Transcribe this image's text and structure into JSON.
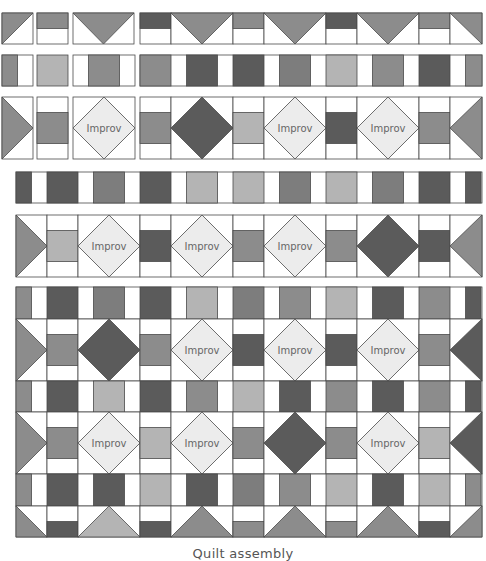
{
  "colors": {
    "dark": "#5b5b5b",
    "medium": "#7d7d7d",
    "mid": "#8c8c8c",
    "light": "#b4b4b4",
    "improv": "#ececec",
    "white": "#ffffff",
    "line": "#4a4a4a"
  },
  "improv_label": "Improv",
  "caption": "Quilt assembly",
  "columns_main": [
    2,
    33,
    72,
    134,
    171,
    233,
    264,
    326,
    357,
    419,
    450,
    482
  ],
  "rows": [
    {
      "id": "row-1-top-border",
      "y": 13,
      "h": 31,
      "pieces": [
        {
          "type": "hst-tl",
          "x": 2,
          "w": 31,
          "color": "mid"
        },
        {
          "type": "rect-top",
          "x": 37,
          "w": 31,
          "color": "mid"
        },
        {
          "type": "goose-down",
          "x": 73,
          "w": 61,
          "color": "mid"
        },
        {
          "type": "rect-top",
          "x": 140,
          "w": 31,
          "color": "dark"
        },
        {
          "type": "goose-down",
          "x": 171,
          "w": 62,
          "color": "mid"
        },
        {
          "type": "rect-top",
          "x": 233,
          "w": 31,
          "color": "mid"
        },
        {
          "type": "goose-down",
          "x": 264,
          "w": 62,
          "color": "mid"
        },
        {
          "type": "rect-top",
          "x": 326,
          "w": 31,
          "color": "dark"
        },
        {
          "type": "goose-down",
          "x": 357,
          "w": 62,
          "color": "mid"
        },
        {
          "type": "rect-top",
          "x": 419,
          "w": 31,
          "color": "mid"
        },
        {
          "type": "hst-tr",
          "x": 450,
          "w": 32,
          "color": "mid"
        }
      ]
    },
    {
      "id": "row-2-sashing",
      "y": 55,
      "h": 31,
      "pieces": [
        {
          "type": "sash-lr",
          "x": 2,
          "w": 31,
          "color": "mid"
        },
        {
          "type": "block",
          "x": 37,
          "w": 31,
          "color": "light"
        },
        {
          "type": "sash-mid",
          "x": 73,
          "w": 62,
          "color": "mid"
        },
        {
          "type": "sash-seq",
          "x": 140,
          "w": 342,
          "seq": [
            "mid",
            "dark",
            "dark",
            "medium",
            "light",
            "mid",
            "dark",
            "mid"
          ]
        }
      ]
    },
    {
      "id": "row-3-blocks",
      "y": 97,
      "h": 62,
      "pieces": [
        {
          "type": "triangle-right",
          "x": 2,
          "w": 31,
          "color": "mid"
        },
        {
          "type": "sq-center",
          "x": 37,
          "w": 31,
          "color": "mid"
        },
        {
          "type": "diamond",
          "x": 73,
          "w": 62,
          "color": "improv",
          "label": true
        },
        {
          "type": "sq-center",
          "x": 140,
          "w": 31,
          "color": "mid"
        },
        {
          "type": "diamond",
          "x": 171,
          "w": 62,
          "color": "dark"
        },
        {
          "type": "sq-center",
          "x": 233,
          "w": 31,
          "color": "light"
        },
        {
          "type": "diamond",
          "x": 264,
          "w": 62,
          "color": "improv",
          "label": true
        },
        {
          "type": "sq-center",
          "x": 326,
          "w": 31,
          "color": "dark"
        },
        {
          "type": "diamond",
          "x": 357,
          "w": 62,
          "color": "improv",
          "label": true
        },
        {
          "type": "sq-center",
          "x": 419,
          "w": 31,
          "color": "mid"
        },
        {
          "type": "triangle-left",
          "x": 450,
          "w": 32,
          "color": "mid"
        }
      ]
    },
    {
      "id": "row-4-sashing",
      "y": 172,
      "h": 31,
      "pieces": [
        {
          "type": "sash-seq-offset",
          "x": 16,
          "w": 466,
          "seq": [
            "dark",
            "dark",
            "medium",
            "dark",
            "light",
            "light",
            "medium",
            "light",
            "medium",
            "dark",
            "dark"
          ]
        }
      ]
    },
    {
      "id": "row-5-blocks",
      "y": 215,
      "h": 62,
      "pieces": [
        {
          "type": "triangle-right",
          "x": 16,
          "w": 31,
          "color": "mid"
        },
        {
          "type": "sq-center",
          "x": 47,
          "w": 31,
          "color": "light"
        },
        {
          "type": "diamond",
          "x": 78,
          "w": 62,
          "color": "improv",
          "label": true
        },
        {
          "type": "sq-center",
          "x": 140,
          "w": 31,
          "color": "dark"
        },
        {
          "type": "diamond",
          "x": 171,
          "w": 62,
          "color": "improv",
          "label": true
        },
        {
          "type": "sq-center",
          "x": 233,
          "w": 31,
          "color": "mid"
        },
        {
          "type": "diamond",
          "x": 264,
          "w": 62,
          "color": "improv",
          "label": true
        },
        {
          "type": "sq-center",
          "x": 326,
          "w": 31,
          "color": "mid"
        },
        {
          "type": "diamond",
          "x": 357,
          "w": 62,
          "color": "dark"
        },
        {
          "type": "sq-center",
          "x": 419,
          "w": 31,
          "color": "dark"
        },
        {
          "type": "triangle-left",
          "x": 450,
          "w": 32,
          "color": "mid"
        }
      ]
    },
    {
      "id": "row-6-sashing",
      "y": 287,
      "h": 32,
      "pieces": [
        {
          "type": "sash-seq-offset",
          "x": 16,
          "w": 466,
          "seq": [
            "mid",
            "dark",
            "medium",
            "dark",
            "light",
            "medium",
            "mid",
            "light",
            "dark",
            "mid",
            "dark"
          ]
        }
      ]
    },
    {
      "id": "row-7-blocks",
      "y": 319,
      "h": 62,
      "pieces": [
        {
          "type": "triangle-right",
          "x": 16,
          "w": 31,
          "color": "mid"
        },
        {
          "type": "sq-center",
          "x": 47,
          "w": 31,
          "color": "mid"
        },
        {
          "type": "diamond",
          "x": 78,
          "w": 62,
          "color": "dark"
        },
        {
          "type": "sq-center",
          "x": 140,
          "w": 31,
          "color": "mid"
        },
        {
          "type": "diamond",
          "x": 171,
          "w": 62,
          "color": "improv",
          "label": true
        },
        {
          "type": "sq-center",
          "x": 233,
          "w": 31,
          "color": "dark"
        },
        {
          "type": "diamond",
          "x": 264,
          "w": 62,
          "color": "improv",
          "label": true
        },
        {
          "type": "sq-center",
          "x": 326,
          "w": 31,
          "color": "dark"
        },
        {
          "type": "diamond",
          "x": 357,
          "w": 62,
          "color": "improv",
          "label": true
        },
        {
          "type": "sq-center",
          "x": 419,
          "w": 31,
          "color": "mid"
        },
        {
          "type": "triangle-left",
          "x": 450,
          "w": 32,
          "color": "dark"
        }
      ]
    },
    {
      "id": "row-8-sashing",
      "y": 381,
      "h": 31,
      "pieces": [
        {
          "type": "sash-seq-offset",
          "x": 16,
          "w": 466,
          "seq": [
            "mid",
            "dark",
            "light",
            "dark",
            "mid",
            "light",
            "dark",
            "mid",
            "dark",
            "mid",
            "dark"
          ]
        }
      ]
    },
    {
      "id": "row-9-blocks",
      "y": 412,
      "h": 62,
      "pieces": [
        {
          "type": "triangle-right",
          "x": 16,
          "w": 31,
          "color": "mid"
        },
        {
          "type": "sq-center",
          "x": 47,
          "w": 31,
          "color": "mid"
        },
        {
          "type": "diamond",
          "x": 78,
          "w": 62,
          "color": "improv",
          "label": true
        },
        {
          "type": "sq-center",
          "x": 140,
          "w": 31,
          "color": "light"
        },
        {
          "type": "diamond",
          "x": 171,
          "w": 62,
          "color": "improv",
          "label": true
        },
        {
          "type": "sq-center",
          "x": 233,
          "w": 31,
          "color": "mid"
        },
        {
          "type": "diamond",
          "x": 264,
          "w": 62,
          "color": "dark"
        },
        {
          "type": "sq-center",
          "x": 326,
          "w": 31,
          "color": "mid"
        },
        {
          "type": "diamond",
          "x": 357,
          "w": 62,
          "color": "improv",
          "label": true
        },
        {
          "type": "sq-center",
          "x": 419,
          "w": 31,
          "color": "light"
        },
        {
          "type": "triangle-left",
          "x": 450,
          "w": 32,
          "color": "dark"
        }
      ]
    },
    {
      "id": "row-10-sashing",
      "y": 474,
      "h": 32,
      "pieces": [
        {
          "type": "sash-seq-offset",
          "x": 16,
          "w": 466,
          "seq": [
            "mid",
            "dark",
            "dark",
            "light",
            "dark",
            "medium",
            "mid",
            "light",
            "dark",
            "light",
            "mid"
          ]
        }
      ]
    },
    {
      "id": "row-11-bottom-border",
      "y": 506,
      "h": 31,
      "pieces": [
        {
          "type": "hst-bl",
          "x": 16,
          "w": 31,
          "color": "mid"
        },
        {
          "type": "rect-bottom",
          "x": 47,
          "w": 31,
          "color": "dark"
        },
        {
          "type": "goose-up",
          "x": 78,
          "w": 62,
          "color": "light"
        },
        {
          "type": "rect-bottom",
          "x": 140,
          "w": 31,
          "color": "dark"
        },
        {
          "type": "goose-up",
          "x": 171,
          "w": 62,
          "color": "mid"
        },
        {
          "type": "rect-bottom",
          "x": 233,
          "w": 31,
          "color": "mid"
        },
        {
          "type": "goose-up",
          "x": 264,
          "w": 62,
          "color": "mid"
        },
        {
          "type": "rect-bottom",
          "x": 326,
          "w": 31,
          "color": "mid"
        },
        {
          "type": "goose-up",
          "x": 357,
          "w": 62,
          "color": "mid"
        },
        {
          "type": "rect-bottom",
          "x": 419,
          "w": 31,
          "color": "dark"
        },
        {
          "type": "hst-br",
          "x": 450,
          "w": 32,
          "color": "mid"
        }
      ]
    }
  ]
}
